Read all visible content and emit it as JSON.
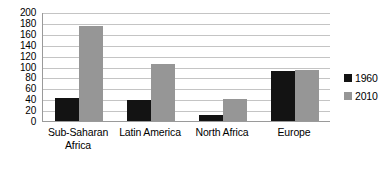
{
  "chart_data": {
    "type": "bar",
    "title": "",
    "xlabel": "",
    "ylabel": "",
    "ylim": [
      0,
      200
    ],
    "ytick_step": 20,
    "yticks": [
      "200",
      "180",
      "160",
      "140",
      "120",
      "100",
      "80",
      "60",
      "40",
      "20",
      "0"
    ],
    "grid": true,
    "legend_position": "right",
    "categories": [
      "Sub-Saharan Africa",
      "Latin America",
      "North Africa",
      "Europe"
    ],
    "category_lines": [
      [
        "Sub-Saharan",
        "Africa"
      ],
      [
        "Latin America"
      ],
      [
        "North Africa"
      ],
      [
        "Europe"
      ]
    ],
    "series": [
      {
        "name": "1960",
        "color": "#131313",
        "values": [
          42,
          38,
          11,
          92
        ]
      },
      {
        "name": "2010",
        "color": "#969696",
        "values": [
          175,
          105,
          40,
          93
        ]
      }
    ]
  },
  "legend": {
    "entries": [
      {
        "label": "1960",
        "color": "#131313"
      },
      {
        "label": "2010",
        "color": "#969696"
      }
    ]
  },
  "colors": {
    "series_1960": "#131313",
    "series_2010": "#969696",
    "gridline": "#c4c4c4",
    "axis": "#9a9a9a",
    "background": "#ffffff",
    "text": "#000000"
  }
}
